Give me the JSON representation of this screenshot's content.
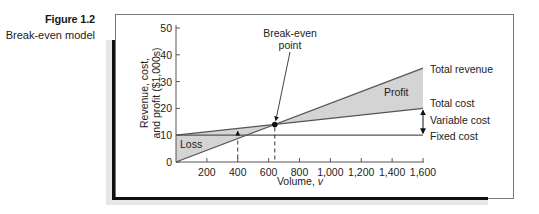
{
  "figure": {
    "number": "Figure 1.2",
    "caption": "Break-even model"
  },
  "chart_data": {
    "type": "line",
    "title": "Break-even model",
    "xlabel": "Volume, v",
    "ylabel_line1": "Revenue, cost,",
    "ylabel_line2": "and profit ($1,000s)",
    "xlim": [
      0,
      1600
    ],
    "ylim": [
      0,
      50
    ],
    "x_ticks": [
      200,
      400,
      600,
      800,
      1000,
      1200,
      1400,
      1600
    ],
    "x_tick_labels": [
      "200",
      "400",
      "600",
      "800",
      "1,000",
      "1,200",
      "1,400",
      "1,600"
    ],
    "y_ticks": [
      0,
      10,
      20,
      30,
      40,
      50
    ],
    "y_tick_labels": [
      "0",
      "10",
      "20",
      "30",
      "40",
      "50"
    ],
    "grid": false,
    "series": [
      {
        "name": "Total revenue",
        "x": [
          0,
          1600
        ],
        "values": [
          0,
          35
        ]
      },
      {
        "name": "Total cost",
        "x": [
          0,
          1600
        ],
        "values": [
          10,
          20
        ]
      },
      {
        "name": "Fixed cost",
        "x": [
          0,
          1600
        ],
        "values": [
          10,
          10
        ]
      }
    ],
    "regions": [
      {
        "name": "Loss",
        "between": [
          "Total cost",
          "Total revenue"
        ],
        "x_range": [
          0,
          640
        ]
      },
      {
        "name": "Profit",
        "between": [
          "Total revenue",
          "Total cost"
        ],
        "x_range": [
          640,
          1600
        ]
      }
    ],
    "annotations": [
      {
        "text": "Break-even point",
        "x": 640,
        "y": 14
      },
      {
        "text": "Variable cost",
        "type": "double-arrow",
        "x": 1600,
        "y_range": [
          10,
          20
        ]
      },
      {
        "text": "dashed marker",
        "x": 400
      },
      {
        "text": "dashed marker",
        "x": 640
      }
    ],
    "labels": {
      "break_even_line1": "Break-even",
      "break_even_line2": "point",
      "total_revenue": "Total revenue",
      "total_cost": "Total cost",
      "variable_cost": "Variable cost",
      "fixed_cost": "Fixed cost",
      "profit": "Profit",
      "loss": "Loss"
    }
  }
}
